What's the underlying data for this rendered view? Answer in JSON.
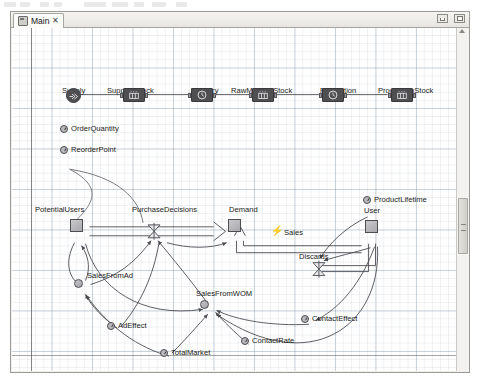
{
  "window": {
    "tab": {
      "label": "Main",
      "close_glyph": "✕",
      "icon": "diagram-icon"
    },
    "buttons": {
      "minimize": "minimize-button",
      "maximize": "maximize-button"
    }
  },
  "canvas": {
    "zoom_hint": "",
    "grid": true
  },
  "scrollbar": {
    "orientation": "vertical",
    "position_pct": 52
  },
  "diagram": {
    "process_chain": {
      "title": "",
      "nodes": [
        {
          "id": "supply",
          "label": "Supply",
          "type": "source",
          "icon": "source-icon",
          "x": 62,
          "y": 76,
          "label_x": 50,
          "label_y": 58
        },
        {
          "id": "supplierStock",
          "label": "SupplierStock",
          "type": "queue",
          "icon": "queue-icon",
          "x": 131,
          "y": 77,
          "label_x": 99,
          "label_y": 58
        },
        {
          "id": "delivery",
          "label": "Delivery",
          "type": "delay",
          "icon": "clock-icon",
          "x": 199,
          "y": 77,
          "label_x": 181,
          "label_y": 58
        },
        {
          "id": "rawMaterialStock",
          "label": "RawMaterialStock",
          "type": "queue",
          "icon": "queue-icon",
          "x": 260,
          "y": 77,
          "label_x": 222,
          "label_y": 58
        },
        {
          "id": "production",
          "label": "Production",
          "type": "delay",
          "icon": "clock-icon",
          "x": 330,
          "y": 77,
          "label_x": 310,
          "label_y": 58
        },
        {
          "id": "productionStock",
          "label": "ProductionStock",
          "type": "queue",
          "icon": "queue-icon",
          "x": 399,
          "y": 77,
          "label_x": 369,
          "label_y": 58
        }
      ],
      "parameters": [
        {
          "id": "orderQuantity",
          "label": "OrderQuantity",
          "x": 57,
          "y": 113,
          "label_x": 68,
          "label_y": 110
        },
        {
          "id": "reorderPoint",
          "label": "ReorderPoint",
          "x": 57,
          "y": 134,
          "label_x": 68,
          "label_y": 131
        }
      ]
    },
    "sd_model": {
      "stocks": [
        {
          "id": "potentialUsers",
          "label": "PotentialUsers",
          "x": 68,
          "y": 209,
          "label_x": 32,
          "label_y": 193
        },
        {
          "id": "demand",
          "label": "Demand",
          "x": 226,
          "y": 209,
          "label_x": 227,
          "label_y": 193
        },
        {
          "id": "user",
          "label": "User",
          "x": 363,
          "y": 210,
          "label_x": 361,
          "label_y": 194
        }
      ],
      "flows": [
        {
          "id": "purchaseDecisions",
          "label": "PurchaseDecisions",
          "x": 153,
          "y": 210,
          "label_x": 131,
          "label_y": 193
        },
        {
          "id": "discards",
          "label": "Discards",
          "x": 315,
          "y": 245,
          "label_x": 300,
          "label_y": 233
        }
      ],
      "auxiliaries": [
        {
          "id": "salesFromAd",
          "label": "SalesFromAd",
          "x": 71,
          "y": 260,
          "label_x": 82,
          "label_y": 252
        },
        {
          "id": "salesFromWOM",
          "label": "SalesFromWOM",
          "x": 197,
          "y": 281,
          "label_x": 193,
          "label_y": 270
        }
      ],
      "parameters": [
        {
          "id": "adEffect",
          "label": "AdEffect",
          "x": 104,
          "y": 303,
          "label_x": 114,
          "label_y": 300
        },
        {
          "id": "totalMarket",
          "label": "TotalMarket",
          "x": 157,
          "y": 330,
          "label_x": 167,
          "label_y": 327
        },
        {
          "id": "contactRate",
          "label": "ContactRate",
          "x": 238,
          "y": 318,
          "label_x": 248,
          "label_y": 315
        },
        {
          "id": "contactEffect",
          "label": "ContactEffect",
          "x": 298,
          "y": 296,
          "label_x": 308,
          "label_y": 293
        },
        {
          "id": "productLifetime",
          "label": "ProductLifetime",
          "x": 360,
          "y": 185,
          "label_x": 370,
          "label_y": 182
        }
      ],
      "events": [
        {
          "id": "sales",
          "label": "Sales",
          "glyph": "⚡",
          "x": 268,
          "y": 208,
          "label_x": 280,
          "label_y": 209
        }
      ]
    }
  }
}
